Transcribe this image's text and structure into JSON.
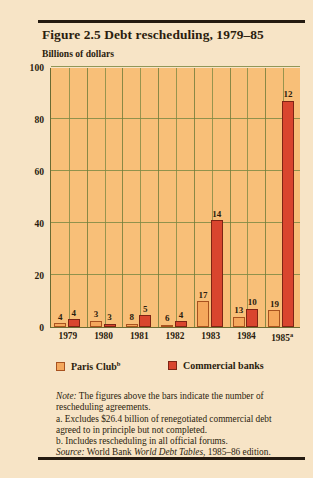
{
  "figure": {
    "title": "Figure 2.5  Debt rescheduling, 1979–85",
    "y_axis_label": "Billions of dollars"
  },
  "legend": {
    "paris_label": "Paris Club",
    "paris_sup": "b",
    "commercial_label": "Commercial banks"
  },
  "notes": {
    "note_lead": "Note:",
    "note_text": " The figures above the bars indicate the number of rescheduling agreements.",
    "a_text": "a. Excludes $26.4 billion of renegotiated commercial debt agreed to in principle but not completed.",
    "b_text": "b. Includes rescheduling in all official forums.",
    "source_lead": "Source:",
    "source_pre": " World Bank ",
    "source_italic": "World Debt Tables",
    "source_post": ", 1985–86 edition."
  },
  "chart_data": {
    "type": "bar",
    "title": "Figure 2.5  Debt rescheduling, 1979–85",
    "xlabel": "",
    "ylabel": "Billions of dollars",
    "ylim": [
      0,
      100
    ],
    "yticks": [
      "0",
      "20",
      "40",
      "60",
      "80",
      "100"
    ],
    "grid": true,
    "legend_position": "below-plot",
    "categories": [
      "1979",
      "1980",
      "1981",
      "1982",
      "1983",
      "1984",
      "1985"
    ],
    "category_labels": [
      "1979",
      "1980",
      "1981",
      "1982",
      "1983",
      "1984",
      "1985a"
    ],
    "series": [
      {
        "name": "Paris Club",
        "color": "#f5a85c",
        "values": [
          1.5,
          2.5,
          1.2,
          0.8,
          10.0,
          4.0,
          6.5
        ],
        "point_labels": [
          "4",
          "3",
          "8",
          "6",
          "17",
          "13",
          "19"
        ]
      },
      {
        "name": "Commercial banks",
        "color": "#d9452e",
        "values": [
          3.0,
          1.2,
          4.5,
          2.2,
          41.0,
          7.0,
          87.0
        ],
        "point_labels": [
          "4",
          "3",
          "5",
          "4",
          "14",
          "10",
          "12"
        ]
      }
    ],
    "annotation": "Figures above the bars indicate the number of rescheduling agreements."
  }
}
